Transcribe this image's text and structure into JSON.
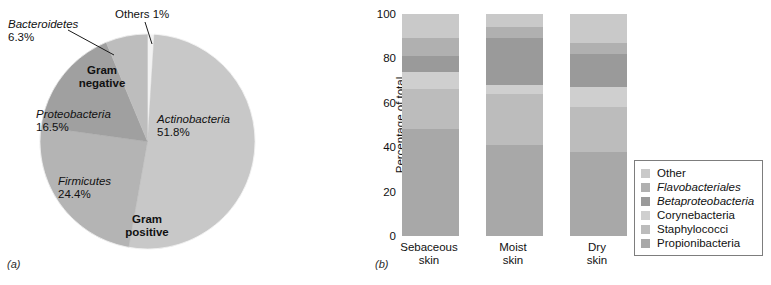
{
  "figure": {
    "panel_a_label": "(a)",
    "panel_b_label": "(b)"
  },
  "chart_data": [
    {
      "type": "pie",
      "title": "",
      "panel": "(a)",
      "categories": [
        "Actinobacteria",
        "Firmicutes",
        "Proteobacteria",
        "Bacteroidetes",
        "Others"
      ],
      "values": [
        51.8,
        24.4,
        16.5,
        6.3,
        1.0
      ],
      "value_labels": [
        "51.8%",
        "24.4%",
        "16.5%",
        "6.3%",
        "1%"
      ],
      "colors": [
        "#c8c8c8",
        "#b4b4b4",
        "#a0a0a0",
        "#bdbdbd",
        "#f2f2f2"
      ],
      "italic_labels": [
        true,
        true,
        true,
        true,
        false
      ],
      "group_labels": [
        {
          "text_line1": "Gram",
          "text_line2": "negative",
          "members": [
            "Proteobacteria",
            "Bacteroidetes"
          ]
        },
        {
          "text_line1": "Gram",
          "text_line2": "positive",
          "members": [
            "Actinobacteria",
            "Firmicutes"
          ]
        }
      ],
      "slices": [
        {
          "name": "Others",
          "label": "Others 1%",
          "pct": 1.0,
          "italic": false,
          "leader": true
        },
        {
          "name": "Actinobacteria",
          "label": "Actinobacteria",
          "pctlabel": "51.8%",
          "pct": 51.8,
          "italic": true,
          "leader": false
        },
        {
          "name": "Firmicutes",
          "label": "Firmicutes",
          "pctlabel": "24.4%",
          "pct": 24.4,
          "italic": true,
          "leader": false
        },
        {
          "name": "Proteobacteria",
          "label": "Proteobacteria",
          "pctlabel": "16.5%",
          "pct": 16.5,
          "italic": true,
          "leader": false
        },
        {
          "name": "Bacteroidetes",
          "label": "Bacteroidetes",
          "pctlabel": "6.3%",
          "pct": 6.3,
          "italic": true,
          "leader": true
        }
      ]
    },
    {
      "type": "bar",
      "panel": "(b)",
      "stacked": true,
      "normalized_100": true,
      "title": "",
      "xlabel": "",
      "ylabel": "Percentage of total",
      "ylim": [
        0,
        100
      ],
      "yticks": [
        100,
        80,
        60,
        40,
        20,
        0
      ],
      "ytick_labels": [
        "100",
        "80",
        "60",
        "40",
        "20",
        "0"
      ],
      "grid": false,
      "legend_position": "right",
      "categories": [
        "Sebaceous skin",
        "Moist skin",
        "Dry skin"
      ],
      "category_lines": [
        {
          "line1": "Sebaceous",
          "line2": "skin"
        },
        {
          "line1": "Moist",
          "line2": "skin"
        },
        {
          "line1": "Dry",
          "line2": "skin"
        }
      ],
      "series": [
        {
          "name": "Other",
          "italic": false,
          "color": "#c9c9c9",
          "values": [
            11,
            6,
            13
          ]
        },
        {
          "name": "Flavobacteriales",
          "italic": true,
          "color": "#b0b0b0",
          "values": [
            8,
            5,
            5
          ]
        },
        {
          "name": "Betaproteobacteria",
          "italic": true,
          "color": "#9a9a9a",
          "values": [
            7,
            21,
            15
          ]
        },
        {
          "name": "Corynebacteria",
          "italic": false,
          "color": "#cfcfcf",
          "values": [
            8,
            4,
            9
          ]
        },
        {
          "name": "Staphylococci",
          "italic": false,
          "color": "#bcbcbc",
          "values": [
            18,
            23,
            20
          ]
        },
        {
          "name": "Propionibacteria",
          "italic": false,
          "color": "#a8a8a8",
          "values": [
            48,
            41,
            38
          ]
        }
      ]
    }
  ],
  "pie_text": {
    "others": "Others 1%",
    "bacteroidetes_name": "Bacteroidetes",
    "bacteroidetes_pct": "6.3%",
    "proteobacteria_name": "Proteobacteria",
    "proteobacteria_pct": "16.5%",
    "firmicutes_name": "Firmicutes",
    "firmicutes_pct": "24.4%",
    "actinobacteria_name": "Actinobacteria",
    "actinobacteria_pct": "51.8%",
    "gram_negative_1": "Gram",
    "gram_negative_2": "negative",
    "gram_positive_1": "Gram",
    "gram_positive_2": "positive"
  },
  "bar_text": {
    "ylabel": "Percentage of total",
    "yticks": [
      "100",
      "80",
      "60",
      "40",
      "20",
      "0"
    ],
    "x0_line1": "Sebaceous",
    "x0_line2": "skin",
    "x1_line1": "Moist",
    "x1_line2": "skin",
    "x2_line1": "Dry",
    "x2_line2": "skin"
  },
  "legend": {
    "items": [
      {
        "label": "Other",
        "color": "#c9c9c9",
        "italic": false
      },
      {
        "label": "Flavobacteriales",
        "color": "#b0b0b0",
        "italic": true
      },
      {
        "label": "Betaproteobacteria",
        "color": "#9a9a9a",
        "italic": true
      },
      {
        "label": "Corynebacteria",
        "color": "#cfcfcf",
        "italic": false
      },
      {
        "label": "Staphylococci",
        "color": "#bcbcbc",
        "italic": false
      },
      {
        "label": "Propionibacteria",
        "color": "#a8a8a8",
        "italic": false
      }
    ]
  }
}
